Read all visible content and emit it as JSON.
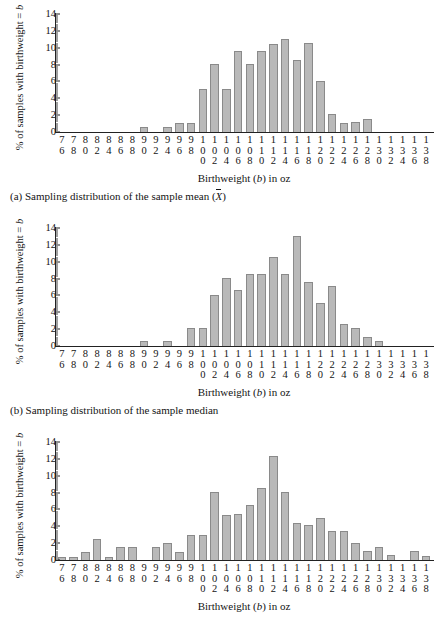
{
  "figure": {
    "axis_x_title": "Birthweight (b) in oz",
    "axis_y_title": "% of samples with birthweight = b",
    "bar_color": "#b9b9b9",
    "bar_border_color": "#8a8a8a"
  },
  "panels": [
    {
      "caption_prefix": "(a)",
      "caption_text": "Sampling distribution of the sample mean (",
      "caption_symbol": "X",
      "caption_suffix": ")"
    },
    {
      "caption_prefix": "(b)",
      "caption_text": "Sampling distribution of the sample median",
      "caption_symbol": "",
      "caption_suffix": ""
    },
    {
      "caption_prefix": "(c)",
      "caption_text": "",
      "caption_symbol": "",
      "caption_suffix": ""
    }
  ],
  "chart_data": [
    {
      "type": "bar",
      "title": "(a) Sampling distribution of the sample mean",
      "xlabel": "Birthweight (b) in oz",
      "ylabel": "% of samples with birthweight = b",
      "ylim": [
        0,
        14
      ],
      "yticks": [
        0,
        2,
        4,
        6,
        8,
        10,
        12,
        14
      ],
      "grid": false,
      "legend": "none",
      "categories": [
        76,
        78,
        80,
        82,
        84,
        86,
        88,
        90,
        92,
        94,
        96,
        98,
        100,
        102,
        104,
        106,
        108,
        110,
        112,
        114,
        116,
        118,
        120,
        122,
        124,
        126,
        128,
        130,
        132,
        134,
        136,
        138
      ],
      "values": [
        0,
        0,
        0,
        0,
        0,
        0,
        0,
        0.6,
        0,
        0.6,
        1.1,
        1.1,
        5.1,
        8.1,
        5.1,
        9.6,
        8.1,
        9.6,
        10.5,
        11.0,
        8.6,
        10.6,
        6.1,
        2.1,
        1.1,
        1.2,
        1.6,
        0,
        0,
        0,
        0,
        0
      ]
    },
    {
      "type": "bar",
      "title": "(b) Sampling distribution of the sample median",
      "xlabel": "Birthweight (b) in oz",
      "ylabel": "% of samples with birthweight = b",
      "ylim": [
        0,
        14
      ],
      "yticks": [
        0,
        2,
        4,
        6,
        8,
        10,
        12,
        14
      ],
      "grid": false,
      "legend": "none",
      "categories": [
        76,
        78,
        80,
        82,
        84,
        86,
        88,
        90,
        92,
        94,
        96,
        98,
        100,
        102,
        104,
        106,
        108,
        110,
        112,
        114,
        116,
        118,
        120,
        122,
        124,
        126,
        128,
        130,
        132,
        134,
        136,
        138
      ],
      "values": [
        0,
        0,
        0,
        0,
        0,
        0,
        0,
        0.6,
        0,
        0.6,
        0,
        2.1,
        2.1,
        6.1,
        8.1,
        6.6,
        8.6,
        8.6,
        10.6,
        8.6,
        13.1,
        7.6,
        5.1,
        7.1,
        2.6,
        2.1,
        1.1,
        0.6,
        0,
        0,
        0,
        0
      ]
    },
    {
      "type": "bar",
      "title": "(c)",
      "xlabel": "Birthweight (b) in oz",
      "ylabel": "% of samples with birthweight = b",
      "ylim": [
        0,
        14
      ],
      "yticks": [
        0,
        2,
        4,
        6,
        8,
        10,
        12,
        14
      ],
      "grid": false,
      "legend": "none",
      "categories": [
        76,
        78,
        80,
        82,
        84,
        86,
        88,
        90,
        92,
        94,
        96,
        98,
        100,
        102,
        104,
        106,
        108,
        110,
        112,
        114,
        116,
        118,
        120,
        122,
        124,
        126,
        128,
        130,
        132,
        134,
        136,
        138
      ],
      "values": [
        0.4,
        0.4,
        1.0,
        2.5,
        0.4,
        1.6,
        1.6,
        0,
        1.6,
        2.0,
        1.0,
        3.0,
        3.0,
        8.1,
        5.4,
        5.5,
        6.5,
        8.5,
        12.4,
        8.1,
        4.4,
        4.1,
        5.0,
        3.5,
        3.5,
        2.0,
        1.1,
        1.5,
        0.6,
        0,
        1.1,
        0.5
      ]
    }
  ]
}
